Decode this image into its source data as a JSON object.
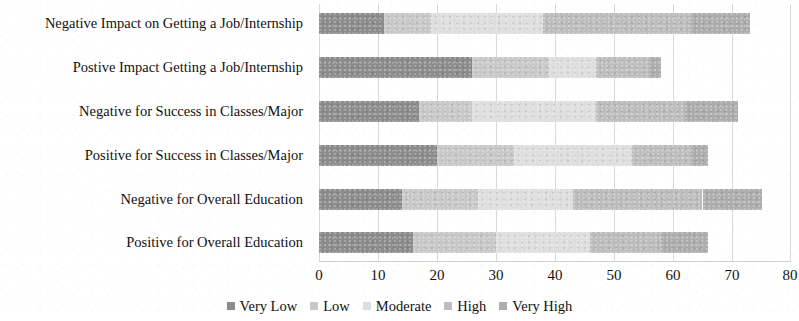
{
  "chart_data": {
    "type": "bar",
    "orientation": "horizontal",
    "stacked": true,
    "title": "",
    "xlabel": "",
    "ylabel": "",
    "xlim": [
      0,
      80
    ],
    "xticks": [
      0,
      10,
      20,
      30,
      40,
      50,
      60,
      70,
      80
    ],
    "xtick_labels": [
      "0",
      "10",
      "20",
      "30",
      "40",
      "50",
      "60",
      "70",
      "80"
    ],
    "grid": true,
    "grid_axis": "x",
    "legend_position": "bottom",
    "categories": [
      "Negative Impact on Getting a Job/Internship",
      "Postive Impact Getting a Job/Internship",
      "Negative for Success in Classes/Major",
      "Positive for Success in Classes/Major",
      "Negative for Overall Education",
      "Positive for Overall Education"
    ],
    "series": [
      {
        "name": "Very Low",
        "color": "#8c8c8c",
        "values": [
          11,
          26,
          17,
          20,
          14,
          16
        ]
      },
      {
        "name": "Low",
        "color": "#c8c8c8",
        "values": [
          8,
          13,
          9,
          13,
          13,
          14
        ]
      },
      {
        "name": "Moderate",
        "color": "#dedede",
        "values": [
          19,
          8,
          21,
          20,
          16,
          16
        ]
      },
      {
        "name": "High",
        "color": "#bdbdbd",
        "values": [
          25,
          9,
          15,
          10,
          22,
          12
        ]
      },
      {
        "name": "Very High",
        "color": "#adadad",
        "values": [
          10,
          2,
          9,
          3,
          10,
          8
        ]
      }
    ],
    "totals": [
      73,
      58,
      71,
      66,
      75,
      66
    ]
  },
  "legend": {
    "items": [
      {
        "label": "Very Low"
      },
      {
        "label": "Low"
      },
      {
        "label": "Moderate"
      },
      {
        "label": "High"
      },
      {
        "label": "Very High"
      }
    ]
  }
}
